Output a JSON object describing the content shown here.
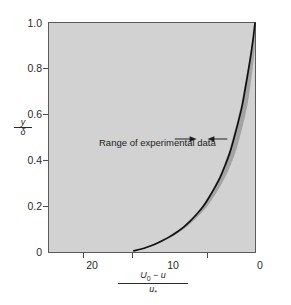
{
  "figure": {
    "background_color": "#ffffff",
    "plot_background_color": "#d2d2d2",
    "frame_color": "#5a5a5a"
  },
  "chart_data": {
    "type": "line",
    "title": "",
    "subtitle": "",
    "xlabel": "(U0 - u) / u*",
    "xlabel_numerator": "U",
    "xlabel_numerator_sub": "0",
    "xlabel_numerator_rest": " − u",
    "xlabel_denominator": "u",
    "xlabel_denominator_sub": "*",
    "ylabel": "y / δ",
    "ylabel_numerator": "y",
    "ylabel_denominator": "δ",
    "x_ticks": [
      20,
      10,
      0
    ],
    "x_tick_labels": [
      "20",
      "10",
      "0"
    ],
    "x_minor_ticks": [
      25,
      15,
      5
    ],
    "xlim": [
      25.5,
      0
    ],
    "x_reversed": true,
    "y_ticks": [
      0,
      0.2,
      0.4,
      0.6,
      0.8,
      1.0
    ],
    "y_tick_labels": [
      "0",
      "0.2",
      "0.4",
      "0.6",
      "0.8",
      "1.0"
    ],
    "ylim": [
      0,
      1.0
    ],
    "grid": false,
    "legend_position": "none",
    "series": [
      {
        "name": "velocity-defect-law",
        "color": "#111111",
        "linewidth": 1.6,
        "x": [
          15.0,
          14.2,
          13.3,
          12.4,
          11.5,
          10.6,
          9.7,
          8.8,
          8.0,
          7.2,
          6.4,
          5.7,
          5.0,
          4.3,
          3.7,
          3.1,
          2.6,
          2.1,
          1.6,
          1.2,
          0.8,
          0.45,
          0.18,
          0.0
        ],
        "y": [
          0.005,
          0.012,
          0.022,
          0.034,
          0.049,
          0.066,
          0.086,
          0.11,
          0.136,
          0.166,
          0.2,
          0.238,
          0.28,
          0.327,
          0.378,
          0.435,
          0.497,
          0.564,
          0.637,
          0.715,
          0.797,
          0.875,
          0.945,
          1.0
        ]
      }
    ],
    "band": {
      "name": "Range of experimental data",
      "color": "#9a9a9a",
      "opacity": 0.85,
      "half_width_x": 0.55,
      "description": "shaded envelope of experimental scatter around the mean defect-law curve"
    },
    "annotations": [
      {
        "name": "range-of-experimental-data",
        "text": "Range of experimental data",
        "x_data": 5.0,
        "y_data": 0.46,
        "arrows": [
          "right-pointing",
          "left-pointing"
        ]
      }
    ]
  },
  "annotation": {
    "label": "Range of experimental data"
  },
  "axes": {
    "y_labels": [
      "1.0",
      "0.8",
      "0.6",
      "0.4",
      "0.2",
      "0"
    ],
    "x_labels": [
      "20",
      "10",
      "0"
    ]
  }
}
